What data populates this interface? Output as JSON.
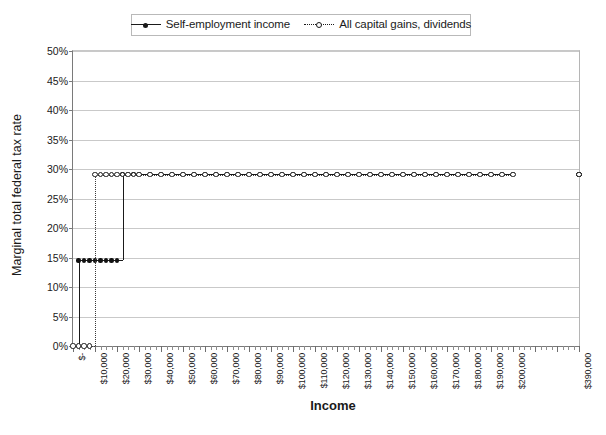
{
  "chart_data": {
    "type": "line",
    "title": "",
    "xlabel": "Income",
    "ylabel": "Marginal total federal tax rate",
    "ylim": [
      0,
      50
    ],
    "y_tick_labels": [
      "50%",
      "45%",
      "40%",
      "35%",
      "30%",
      "25%",
      "20%",
      "15%",
      "10%",
      "5%",
      "0%"
    ],
    "y_tick_values": [
      50,
      45,
      40,
      35,
      30,
      25,
      20,
      15,
      10,
      5,
      0
    ],
    "grid": "horizontal",
    "legend_position": "top-center",
    "x_tick_labels": [
      "$-",
      "$10,000",
      "$20,000",
      "$30,000",
      "$40,000",
      "$50,000",
      "$60,000",
      "$70,000",
      "$80,000",
      "$90,000",
      "$100,000",
      "$110,000",
      "$120,000",
      "$130,000",
      "$140,000",
      "$150,000",
      "$160,000",
      "$170,000",
      "$180,000",
      "$190,000",
      "$200,000",
      "$390,000"
    ],
    "x_tick_values": [
      0,
      10000,
      20000,
      30000,
      40000,
      50000,
      60000,
      70000,
      80000,
      90000,
      100000,
      110000,
      120000,
      130000,
      140000,
      150000,
      160000,
      170000,
      180000,
      190000,
      200000,
      390000
    ],
    "series": [
      {
        "name": "Self-employment income",
        "style": "solid",
        "marker": "filled-circle",
        "color": "#1a1a1a",
        "x": [
          0,
          2500,
          5000,
          7500,
          10000,
          12500,
          15000,
          17500,
          20000,
          22500,
          25000,
          27500,
          30000,
          35000,
          40000,
          45000,
          50000,
          55000,
          60000,
          65000,
          70000,
          75000,
          80000,
          85000,
          90000,
          95000,
          100000,
          105000,
          110000,
          115000,
          120000,
          125000,
          130000,
          135000,
          140000,
          145000,
          150000,
          155000,
          160000,
          165000,
          170000,
          175000,
          180000,
          185000,
          190000,
          195000,
          200000,
          380000,
          385000,
          390000
        ],
        "y": [
          0,
          14.5,
          14.5,
          14.5,
          14.5,
          14.5,
          14.5,
          14.5,
          14.5,
          29.2,
          29.2,
          29.2,
          29.2,
          29.2,
          29.2,
          29.2,
          29.2,
          29.2,
          29.2,
          29.2,
          29.2,
          29.2,
          29.2,
          29.2,
          29.2,
          29.2,
          29.2,
          29.2,
          29.2,
          29.2,
          29.2,
          29.2,
          29.2,
          29.2,
          29.2,
          29.2,
          29.2,
          29.2,
          29.2,
          29.2,
          29.2,
          29.2,
          29.2,
          29.2,
          29.2,
          29.2,
          29.2,
          29.2,
          29.2,
          29.2
        ]
      },
      {
        "name": "All capital gains, dividends",
        "style": "dotted",
        "marker": "open-circle",
        "color": "#1a1a1a",
        "x": [
          0,
          2500,
          5000,
          7500,
          10000,
          12500,
          15000,
          17500,
          20000,
          22500,
          25000,
          27500,
          30000,
          35000,
          40000,
          45000,
          50000,
          55000,
          60000,
          65000,
          70000,
          75000,
          80000,
          85000,
          90000,
          95000,
          100000,
          105000,
          110000,
          115000,
          120000,
          125000,
          130000,
          135000,
          140000,
          145000,
          150000,
          155000,
          160000,
          165000,
          170000,
          175000,
          180000,
          185000,
          190000,
          195000,
          200000,
          380000,
          385000,
          390000
        ],
        "y": [
          0,
          0,
          0,
          0,
          29.0,
          29.0,
          29.0,
          29.0,
          29.0,
          29.0,
          29.0,
          29.0,
          29.0,
          29.0,
          29.0,
          29.0,
          29.0,
          29.0,
          29.0,
          29.0,
          29.0,
          29.0,
          29.0,
          29.0,
          29.0,
          29.0,
          29.0,
          29.0,
          29.0,
          29.0,
          29.0,
          29.0,
          29.0,
          29.0,
          29.0,
          29.0,
          29.0,
          29.0,
          29.0,
          29.0,
          29.0,
          29.0,
          29.0,
          29.0,
          29.0,
          29.0,
          29.0,
          29.0,
          29.0,
          29.0
        ]
      }
    ]
  },
  "legend": {
    "entries": [
      {
        "label": "Self-employment income",
        "key": "solid-line-filled-marker"
      },
      {
        "label": "All capital gains, dividends",
        "key": "dotted-line-open-marker"
      }
    ]
  }
}
